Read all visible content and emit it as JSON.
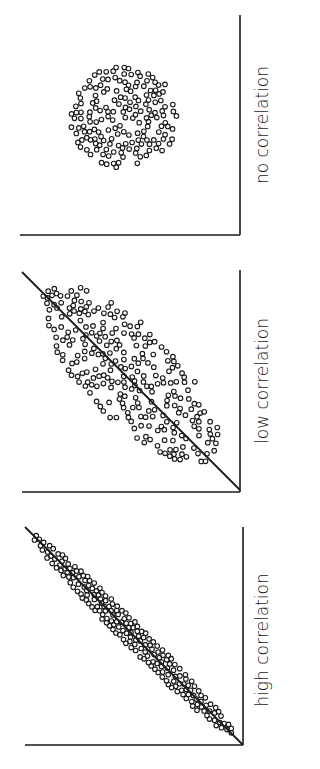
{
  "figure": {
    "orientation": "rotated-90-clockwise",
    "background": "#ffffff",
    "ink": "#1a1a1a"
  },
  "chart_data": [
    {
      "type": "scatter",
      "title": "no correlation",
      "panel": {
        "x0": 20,
        "y0": 15,
        "x1": 240,
        "y1": 235
      },
      "cloud": {
        "shape": "ellipse",
        "cx": 124,
        "cy": 117,
        "rx": 54,
        "ry": 51,
        "angle": 0,
        "count": 170,
        "seed": 11
      },
      "trend_line": null,
      "label_pos": {
        "x": 268,
        "y": 125
      },
      "xlabel": "",
      "ylabel": "",
      "grid": false,
      "legend": null
    },
    {
      "type": "scatter",
      "title": "low correlation",
      "panel": {
        "x0": 22,
        "y0": 270,
        "x1": 240,
        "y1": 492
      },
      "cloud": {
        "shape": "ellipse",
        "cx": 130,
        "cy": 374,
        "rx": 118,
        "ry": 46,
        "angle": 45,
        "count": 260,
        "seed": 29
      },
      "trend_line": {
        "x1": 22,
        "y1": 272,
        "x2": 240,
        "y2": 490
      },
      "label_pos": {
        "x": 268,
        "y": 381
      },
      "xlabel": "",
      "ylabel": "",
      "grid": false,
      "legend": null
    },
    {
      "type": "scatter",
      "title": "high correlation",
      "panel": {
        "x0": 25,
        "y0": 527,
        "x1": 243,
        "y1": 745
      },
      "cloud": {
        "shape": "ellipse",
        "cx": 134,
        "cy": 636,
        "rx": 142,
        "ry": 11,
        "angle": 45,
        "count": 200,
        "seed": 53
      },
      "trend_line": {
        "x1": 25,
        "y1": 527,
        "x2": 243,
        "y2": 745
      },
      "label_pos": {
        "x": 268,
        "y": 640
      },
      "xlabel": "",
      "ylabel": "",
      "grid": false,
      "legend": null
    }
  ]
}
